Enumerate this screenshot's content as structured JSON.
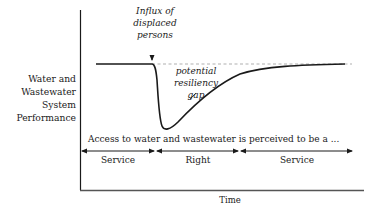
{
  "diagram": {
    "y_axis_label": [
      "Water and",
      "Wastewater",
      "System",
      "Performance"
    ],
    "x_axis_label": "Time",
    "event_annotation": [
      "Influx of",
      "displaced",
      "persons"
    ],
    "gap_annotation": [
      "potential",
      "resiliency",
      "gap"
    ],
    "access_statement": "Access to water and wastewater is perceived to be a ...",
    "phases": [
      {
        "label": "Service"
      },
      {
        "label": "Right"
      },
      {
        "label": "Service"
      }
    ],
    "colors": {
      "line": "#1a1a1a",
      "dashed_reference": "#b0b0b0",
      "axis": "#1a1a1a"
    }
  }
}
